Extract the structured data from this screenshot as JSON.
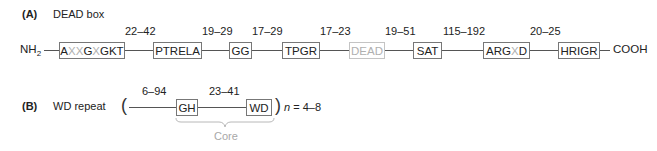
{
  "panel_a": {
    "label": "(A)",
    "title": "DEAD box",
    "n_terminus": "NH",
    "n_terminus_sub": "2",
    "c_terminus": "COOH",
    "motifs": [
      {
        "parts": [
          {
            "t": "A",
            "gray": false
          },
          {
            "t": "XX",
            "gray": true
          },
          {
            "t": "G",
            "gray": false
          },
          {
            "t": "X",
            "gray": true
          },
          {
            "t": "GKT",
            "gray": false
          }
        ],
        "text": "AXXGXGKT"
      },
      {
        "text": "PTRELA"
      },
      {
        "text": "GG"
      },
      {
        "text": "TPGR"
      },
      {
        "text": "DEAD",
        "faded": true
      },
      {
        "text": "SAT"
      },
      {
        "parts": [
          {
            "t": "ARG",
            "gray": false
          },
          {
            "t": "X",
            "gray": true
          },
          {
            "t": "D",
            "gray": false
          }
        ],
        "text": "ARGXD"
      },
      {
        "text": "HRIGR"
      }
    ],
    "spacers": [
      "22–42",
      "19–29",
      "17–29",
      "17–23",
      "19–51",
      "115–192",
      "20–25"
    ]
  },
  "panel_b": {
    "label": "(B)",
    "title": "WD repeat",
    "open_paren": "(",
    "close_paren": ")",
    "repeat_n": "n",
    "repeat_range": " = 4–8",
    "motifs": [
      {
        "text": "GH"
      },
      {
        "text": "WD"
      }
    ],
    "spacers": [
      "6–94",
      "23–41"
    ],
    "core_label": "Core"
  },
  "colors": {
    "line": "#555555",
    "box_border": "#777777",
    "faded": "#b0b0b0"
  }
}
